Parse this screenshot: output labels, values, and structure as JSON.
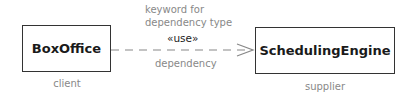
{
  "diagram": {
    "client_class": {
      "name": "BoxOffice",
      "role": "client"
    },
    "supplier_class": {
      "name": "SchedulingEngine",
      "role": "supplier"
    },
    "relationship": {
      "keyword": "«use»",
      "annotation_line1": "keyword for",
      "annotation_line2": "dependency type",
      "label": "dependency",
      "style": "dashed-open-arrow"
    },
    "colors": {
      "line": "#888888",
      "box_border": "#333333",
      "annotation": "#888888",
      "text": "#1a1a1a"
    }
  }
}
